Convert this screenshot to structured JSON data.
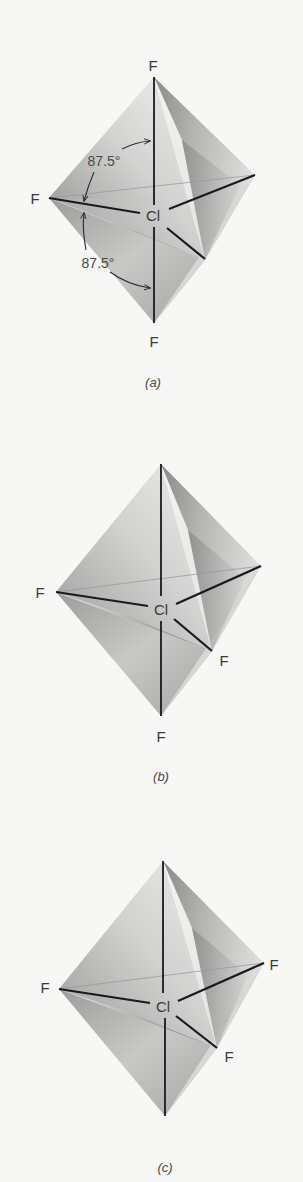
{
  "figure": {
    "molecule": "ClF3",
    "geometry": "trigonal bipyramid",
    "panels": [
      {
        "id": "a",
        "caption": "(a)",
        "central_atom": "Cl",
        "labels": {
          "top": "F",
          "left": "F",
          "bottom": "F"
        },
        "angles": [
          {
            "label": "87.5°",
            "between": "top F and left F"
          },
          {
            "label": "87.5°",
            "between": "left F and bottom F"
          }
        ]
      },
      {
        "id": "b",
        "caption": "(b)",
        "central_atom": "Cl",
        "labels": {
          "left": "F",
          "front_right": "F",
          "bottom": "F"
        }
      },
      {
        "id": "c",
        "caption": "(c)",
        "central_atom": "Cl",
        "labels": {
          "left": "F",
          "right": "F",
          "front_right": "F"
        }
      }
    ]
  },
  "colors": {
    "background": "#f7f7f5",
    "face_light": "#e6e6e4",
    "face_mid": "#bdbdbb",
    "face_dark": "#8f8f8d",
    "bond": "#1a1a1a",
    "text": "#3a3a3a"
  }
}
